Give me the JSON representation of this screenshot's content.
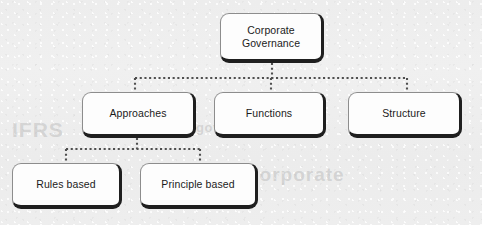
{
  "page": {
    "background_color": "#eeeeee",
    "header_text": "Session Content",
    "ghost_text_left": "IFRS",
    "ghost_text_right": "corporate",
    "ghost_text_mid": "governance"
  },
  "diagram": {
    "type": "hierarchy-tree",
    "title": "Corporate Governance",
    "node_fill_color": "#fdfdfd",
    "node_border_color": "#1f1f1f",
    "connector_color": "#555555",
    "connector_style": "dotted",
    "nodes": [
      {
        "id": "root",
        "label": "Corporate\nGovernance",
        "level": 0
      },
      {
        "id": "approaches",
        "label": "Approaches",
        "level": 1
      },
      {
        "id": "functions",
        "label": "Functions",
        "level": 1
      },
      {
        "id": "structure",
        "label": "Structure",
        "level": 1
      },
      {
        "id": "rules",
        "label": "Rules based",
        "level": 2
      },
      {
        "id": "principle",
        "label": "Principle based",
        "level": 2
      }
    ],
    "edges": [
      {
        "from": "root",
        "to": "approaches"
      },
      {
        "from": "root",
        "to": "functions"
      },
      {
        "from": "root",
        "to": "structure"
      },
      {
        "from": "approaches",
        "to": "rules"
      },
      {
        "from": "approaches",
        "to": "principle"
      }
    ]
  }
}
